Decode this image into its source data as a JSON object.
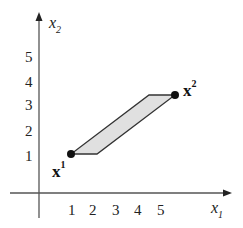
{
  "diagram": {
    "axes": {
      "x": {
        "label": "x",
        "subscript": "1",
        "ticks": [
          "1",
          "2",
          "3",
          "4",
          "5"
        ]
      },
      "y": {
        "label": "x",
        "subscript": "2",
        "ticks": [
          "1",
          "2",
          "3",
          "4",
          "5"
        ]
      }
    },
    "points": [
      {
        "name": "x",
        "superscript": "1",
        "coords": [
          1,
          1
        ]
      },
      {
        "name": "x",
        "superscript": "2",
        "coords": [
          4.5,
          3.5
        ]
      }
    ],
    "region": {
      "shape": "parallelogram",
      "vertices": [
        [
          1,
          1
        ],
        [
          2,
          1
        ],
        [
          4.5,
          3.5
        ],
        [
          3.5,
          3.5
        ]
      ],
      "fill": "#e0e0e0",
      "stroke": "#333333"
    }
  }
}
